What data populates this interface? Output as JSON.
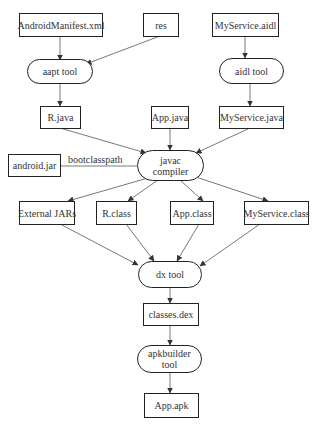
{
  "diagram": {
    "nodes": {
      "manifest": "AndroidManifest.xml",
      "res": "res",
      "aidl_file": "MyService.aidl",
      "aapt": "aapt tool",
      "aidl_tool": "aidl tool",
      "r_java": "R.java",
      "app_java": "App.java",
      "service_java": "MyService.java",
      "android_jar": "android.jar",
      "javac_line1": "javac",
      "javac_line2": "compiler",
      "external_jars": "External JARs",
      "r_class": "R.class",
      "app_class": "App.class",
      "service_class": "MyService.class",
      "dx": "dx tool",
      "classes_dex": "classes.dex",
      "apkbuilder_line1": "apkbuilder",
      "apkbuilder_line2": "tool",
      "app_apk": "App.apk"
    },
    "edge_labels": {
      "bootclasspath": "bootclasspath"
    },
    "edges": [
      [
        "AndroidManifest.xml",
        "aapt tool"
      ],
      [
        "res",
        "aapt tool"
      ],
      [
        "MyService.aidl",
        "aidl tool"
      ],
      [
        "aapt tool",
        "R.java"
      ],
      [
        "aidl tool",
        "MyService.java"
      ],
      [
        "R.java",
        "javac compiler"
      ],
      [
        "App.java",
        "javac compiler"
      ],
      [
        "MyService.java",
        "javac compiler"
      ],
      [
        "android.jar",
        "javac compiler",
        "bootclasspath"
      ],
      [
        "javac compiler",
        "External JARs"
      ],
      [
        "javac compiler",
        "R.class"
      ],
      [
        "javac compiler",
        "App.class"
      ],
      [
        "javac compiler",
        "MyService.class"
      ],
      [
        "External JARs",
        "dx tool"
      ],
      [
        "R.class",
        "dx tool"
      ],
      [
        "App.class",
        "dx tool"
      ],
      [
        "MyService.class",
        "dx tool"
      ],
      [
        "dx tool",
        "classes.dex"
      ],
      [
        "classes.dex",
        "apkbuilder tool"
      ],
      [
        "apkbuilder tool",
        "App.apk"
      ]
    ]
  }
}
